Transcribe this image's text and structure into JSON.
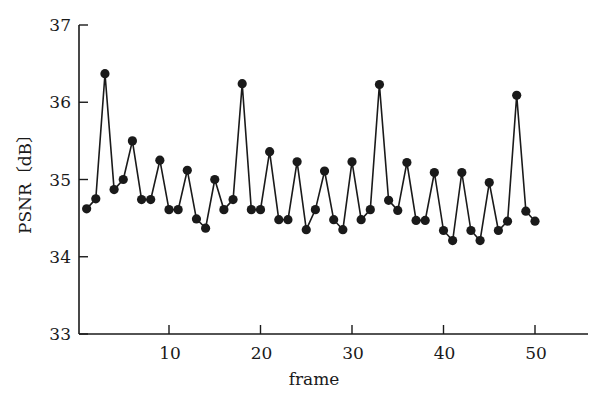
{
  "chart_data": {
    "type": "line",
    "title": "",
    "xlabel": "frame",
    "ylabel": "PSNR〔dB〕",
    "xlim": [
      0,
      54
    ],
    "ylim": [
      33,
      37
    ],
    "x_ticks": [
      10,
      20,
      30,
      40,
      50
    ],
    "y_ticks": [
      33,
      34,
      35,
      36,
      37
    ],
    "grid": false,
    "legend": null,
    "marker": "filled-circle",
    "line_color": "#1a1a1a",
    "series": [
      {
        "name": "PSNR",
        "x": [
          1,
          2,
          3,
          4,
          5,
          6,
          7,
          8,
          9,
          10,
          11,
          12,
          13,
          14,
          15,
          16,
          17,
          18,
          19,
          20,
          21,
          22,
          23,
          24,
          25,
          26,
          27,
          28,
          29,
          30,
          31,
          32,
          33,
          34,
          35,
          36,
          37,
          38,
          39,
          40,
          41,
          42,
          43,
          44,
          45,
          46,
          47,
          48,
          49,
          50
        ],
        "values": [
          34.62,
          34.75,
          36.37,
          34.87,
          35.0,
          35.5,
          34.74,
          34.74,
          35.25,
          34.61,
          34.61,
          35.12,
          34.49,
          34.37,
          35.0,
          34.61,
          34.74,
          36.24,
          34.61,
          34.61,
          35.36,
          34.48,
          34.48,
          35.23,
          34.35,
          34.61,
          35.11,
          34.48,
          34.35,
          35.23,
          34.48,
          34.61,
          36.23,
          34.73,
          34.6,
          35.22,
          34.47,
          34.47,
          35.09,
          34.34,
          34.21,
          35.09,
          34.34,
          34.21,
          34.96,
          34.34,
          34.46,
          36.09,
          34.59,
          34.46
        ]
      }
    ]
  }
}
